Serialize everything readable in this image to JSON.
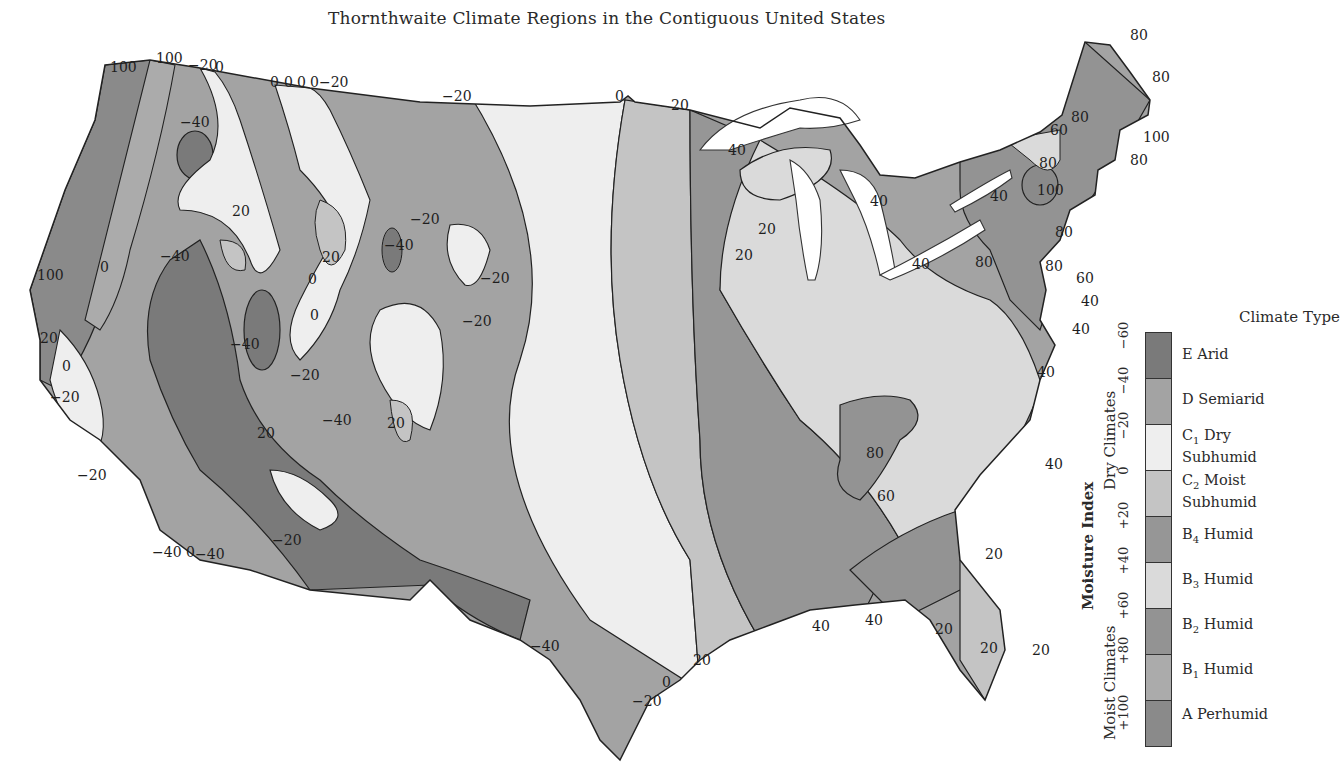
{
  "title": "Thornthwaite Climate Regions in the Contiguous United States",
  "legend": {
    "title": "Climate Type",
    "axis_title": "Moisture Index",
    "group_dry": "Dry Climates",
    "group_moist": "Moist Climates",
    "items": [
      {
        "code": "E",
        "sub": "",
        "name": "Arid",
        "line2": "",
        "color": "#7a7a7a",
        "range": "-60 to -40"
      },
      {
        "code": "D",
        "sub": "",
        "name": "Semiarid",
        "line2": "",
        "color": "#a3a3a3",
        "range": "-40 to -20"
      },
      {
        "code": "C",
        "sub": "1",
        "name": "Dry",
        "line2": "Subhumid",
        "color": "#eeeeee",
        "range": "-20 to 0"
      },
      {
        "code": "C",
        "sub": "2",
        "name": "Moist",
        "line2": "Subhumid",
        "color": "#c4c4c4",
        "range": "0 to +20"
      },
      {
        "code": "B",
        "sub": "4",
        "name": "Humid",
        "line2": "",
        "color": "#969696",
        "range": "+20 to +40"
      },
      {
        "code": "B",
        "sub": "3",
        "name": "Humid",
        "line2": "",
        "color": "#dadada",
        "range": "+40 to +60"
      },
      {
        "code": "B",
        "sub": "2",
        "name": "Humid",
        "line2": "",
        "color": "#939393",
        "range": "+60 to +80"
      },
      {
        "code": "B",
        "sub": "1",
        "name": "Humid",
        "line2": "",
        "color": "#ababab",
        "range": "+80 to +100"
      },
      {
        "code": "A",
        "sub": "",
        "name": "Perhumid",
        "line2": "",
        "color": "#8a8a8a",
        "range": "> +100"
      }
    ],
    "ticks": [
      "-60",
      "-40",
      "-20",
      "0",
      "+20",
      "+40",
      "+60",
      "+80",
      "+100"
    ]
  },
  "chart_data": {
    "type": "heatmap",
    "title": "Thornthwaite Climate Regions in the Contiguous United States",
    "legend_title": "Climate Type",
    "scale_label": "Moisture Index",
    "scale_ticks": [
      -60,
      -40,
      -20,
      0,
      20,
      40,
      60,
      80,
      100
    ],
    "classes": [
      "E Arid",
      "D Semiarid",
      "C1 Dry Subhumid",
      "C2 Moist Subhumid",
      "B4 Humid",
      "B3 Humid",
      "B2 Humid",
      "B1 Humid",
      "A Perhumid"
    ],
    "groups": {
      "Dry Climates": [
        -60,
        0
      ],
      "Moist Climates": [
        0,
        100
      ]
    },
    "contour_labels": [
      {
        "region": "Pacific Northwest",
        "values": [
          100,
          100,
          -20,
          0,
          0,
          0,
          0,
          0,
          -20,
          -40,
          20
        ]
      },
      {
        "region": "Northern Plains",
        "values": [
          -20,
          0,
          20
        ]
      },
      {
        "region": "Great Lakes",
        "values": [
          40,
          40,
          40,
          40,
          20,
          20
        ]
      },
      {
        "region": "Northeast",
        "values": [
          80,
          80,
          60,
          80,
          100,
          80,
          80,
          100,
          80,
          80,
          80,
          60
        ]
      },
      {
        "region": "Mid-Atlantic",
        "values": [
          40,
          40,
          40
        ]
      },
      {
        "region": "California",
        "values": [
          100,
          20,
          0,
          -20,
          -20,
          -40,
          0,
          -40
        ]
      },
      {
        "region": "Intermountain West",
        "values": [
          -40,
          -40,
          0,
          0,
          -20,
          -40,
          20,
          20,
          20,
          -20,
          -40,
          -20,
          -20,
          -20,
          20
        ]
      },
      {
        "region": "Southwest / Texas",
        "values": [
          -40,
          -20,
          0,
          20
        ]
      },
      {
        "region": "Southeast",
        "values": [
          80,
          60,
          40,
          40,
          20,
          20,
          20,
          20
        ]
      }
    ]
  },
  "map_labels": [
    {
      "t": "100",
      "x": 110,
      "y": 72
    },
    {
      "t": "100",
      "x": 156,
      "y": 63
    },
    {
      "t": "−20",
      "x": 188,
      "y": 70
    },
    {
      "t": "0",
      "x": 215,
      "y": 72
    },
    {
      "t": "0",
      "x": 270,
      "y": 87
    },
    {
      "t": "0",
      "x": 284,
      "y": 87
    },
    {
      "t": "0",
      "x": 297,
      "y": 87
    },
    {
      "t": "0−20",
      "x": 310,
      "y": 87
    },
    {
      "t": "−20",
      "x": 442,
      "y": 101
    },
    {
      "t": "0",
      "x": 615,
      "y": 101
    },
    {
      "t": "20",
      "x": 671,
      "y": 110
    },
    {
      "t": "−40",
      "x": 180,
      "y": 127
    },
    {
      "t": "40",
      "x": 728,
      "y": 155
    },
    {
      "t": "20",
      "x": 232,
      "y": 216
    },
    {
      "t": "−20",
      "x": 410,
      "y": 224
    },
    {
      "t": "−40",
      "x": 384,
      "y": 250
    },
    {
      "t": "20",
      "x": 322,
      "y": 262
    },
    {
      "t": "−40",
      "x": 160,
      "y": 261
    },
    {
      "t": "0",
      "x": 100,
      "y": 272
    },
    {
      "t": "100",
      "x": 37,
      "y": 280
    },
    {
      "t": "0",
      "x": 308,
      "y": 284
    },
    {
      "t": "−20",
      "x": 480,
      "y": 283
    },
    {
      "t": "0",
      "x": 310,
      "y": 320
    },
    {
      "t": "20",
      "x": 758,
      "y": 234
    },
    {
      "t": "20",
      "x": 735,
      "y": 260
    },
    {
      "t": "−20",
      "x": 462,
      "y": 326
    },
    {
      "t": "−40",
      "x": 230,
      "y": 349
    },
    {
      "t": "−20",
      "x": 290,
      "y": 380
    },
    {
      "t": "20",
      "x": 40,
      "y": 343
    },
    {
      "t": "0",
      "x": 62,
      "y": 371
    },
    {
      "t": "−20",
      "x": 50,
      "y": 402
    },
    {
      "t": "−40",
      "x": 322,
      "y": 425
    },
    {
      "t": "20",
      "x": 387,
      "y": 428
    },
    {
      "t": "20",
      "x": 257,
      "y": 438
    },
    {
      "t": "−20",
      "x": 77,
      "y": 480
    },
    {
      "t": "−20",
      "x": 272,
      "y": 545
    },
    {
      "t": "−40",
      "x": 152,
      "y": 557
    },
    {
      "t": "0",
      "x": 186,
      "y": 557
    },
    {
      "t": "−40",
      "x": 195,
      "y": 559
    },
    {
      "t": "−40",
      "x": 530,
      "y": 651
    },
    {
      "t": "20",
      "x": 693,
      "y": 665
    },
    {
      "t": "0",
      "x": 662,
      "y": 687
    },
    {
      "t": "−20",
      "x": 632,
      "y": 706
    },
    {
      "t": "40",
      "x": 812,
      "y": 631
    },
    {
      "t": "40",
      "x": 865,
      "y": 625
    },
    {
      "t": "20",
      "x": 935,
      "y": 634
    },
    {
      "t": "20",
      "x": 980,
      "y": 653
    },
    {
      "t": "20",
      "x": 1032,
      "y": 655
    },
    {
      "t": "20",
      "x": 985,
      "y": 559
    },
    {
      "t": "40",
      "x": 1045,
      "y": 469
    },
    {
      "t": "80",
      "x": 866,
      "y": 458
    },
    {
      "t": "60",
      "x": 877,
      "y": 501
    },
    {
      "t": "40",
      "x": 1037,
      "y": 377
    },
    {
      "t": "40",
      "x": 1072,
      "y": 334
    },
    {
      "t": "40",
      "x": 1081,
      "y": 306
    },
    {
      "t": "60",
      "x": 1076,
      "y": 283
    },
    {
      "t": "80",
      "x": 975,
      "y": 267
    },
    {
      "t": "80",
      "x": 1045,
      "y": 271
    },
    {
      "t": "80",
      "x": 1055,
      "y": 237
    },
    {
      "t": "100",
      "x": 1037,
      "y": 195
    },
    {
      "t": "80",
      "x": 1039,
      "y": 168
    },
    {
      "t": "40",
      "x": 990,
      "y": 201
    },
    {
      "t": "40",
      "x": 912,
      "y": 269
    },
    {
      "t": "40",
      "x": 870,
      "y": 206
    },
    {
      "t": "60",
      "x": 1050,
      "y": 135
    },
    {
      "t": "80",
      "x": 1071,
      "y": 122
    },
    {
      "t": "80",
      "x": 1130,
      "y": 165
    },
    {
      "t": "100",
      "x": 1143,
      "y": 142
    },
    {
      "t": "80",
      "x": 1152,
      "y": 82
    },
    {
      "t": "80",
      "x": 1130,
      "y": 40
    }
  ]
}
